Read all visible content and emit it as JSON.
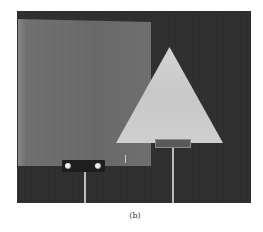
{
  "figure": {
    "caption": "(b)",
    "elements": [
      {
        "name": "square-plate",
        "shape": "square"
      },
      {
        "name": "triangular-plate",
        "shape": "triangle"
      }
    ]
  }
}
